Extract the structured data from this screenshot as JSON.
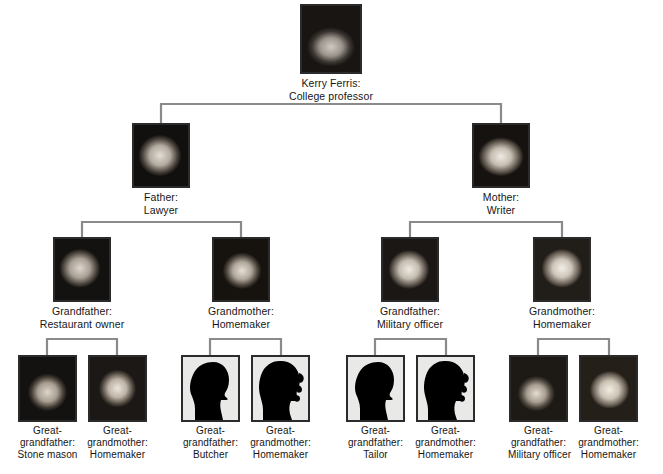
{
  "diagram": {
    "type": "family-tree",
    "generations": 4,
    "line_color": "#808080",
    "frame_color": "#2b2b2b",
    "background": "#ffffff",
    "text_color": "#161616"
  },
  "generation1": {
    "label": "Self",
    "people": [
      {
        "id": "kerry",
        "name_line": "Kerry Ferris:",
        "role_line": "College professor",
        "photo": "photo-kerry-ferris",
        "photo_type": "photograph"
      }
    ]
  },
  "generation2": {
    "label": "Parents",
    "people": [
      {
        "id": "father",
        "name_line": "Father:",
        "role_line": "Lawyer",
        "photo": "photo-father",
        "photo_type": "photograph"
      },
      {
        "id": "mother",
        "name_line": "Mother:",
        "role_line": "Writer",
        "photo": "photo-mother",
        "photo_type": "photograph"
      }
    ]
  },
  "generation3": {
    "label": "Grandparents",
    "people": [
      {
        "id": "grandfather-paternal",
        "name_line": "Grandfather:",
        "role_line": "Restaurant owner",
        "photo": "photo-grandfather-paternal",
        "photo_type": "photograph"
      },
      {
        "id": "grandmother-paternal",
        "name_line": "Grandmother:",
        "role_line": "Homemaker",
        "photo": "photo-grandmother-paternal",
        "photo_type": "photograph"
      },
      {
        "id": "grandfather-maternal",
        "name_line": "Grandfather:",
        "role_line": "Military officer",
        "photo": "photo-grandfather-maternal",
        "photo_type": "photograph"
      },
      {
        "id": "grandmother-maternal",
        "name_line": "Grandmother:",
        "role_line": "Homemaker",
        "photo": "photo-grandmother-maternal",
        "photo_type": "photograph"
      }
    ]
  },
  "generation4": {
    "label": "Great-grandparents",
    "people": [
      {
        "id": "great-grandfather-1",
        "name_line1": "Great-",
        "name_line2": "grandfather:",
        "role_line": "Stone mason",
        "photo": "photo-great-grandfather-stone-mason",
        "photo_type": "photograph"
      },
      {
        "id": "great-grandmother-1",
        "name_line1": "Great-",
        "name_line2": "grandmother:",
        "role_line": "Homemaker",
        "photo": "photo-great-grandmother-homemaker-1",
        "photo_type": "photograph"
      },
      {
        "id": "great-grandfather-2",
        "name_line1": "Great-",
        "name_line2": "grandfather:",
        "role_line": "Butcher",
        "photo": "silhouette-male",
        "photo_type": "silhouette"
      },
      {
        "id": "great-grandmother-2",
        "name_line1": "Great-",
        "name_line2": "grandmother:",
        "role_line": "Homemaker",
        "photo": "silhouette-female",
        "photo_type": "silhouette"
      },
      {
        "id": "great-grandfather-3",
        "name_line1": "Great-",
        "name_line2": "grandfather:",
        "role_line": "Tailor",
        "photo": "silhouette-male",
        "photo_type": "silhouette"
      },
      {
        "id": "great-grandmother-3",
        "name_line1": "Great-",
        "name_line2": "grandmother:",
        "role_line": "Homemaker",
        "photo": "silhouette-female",
        "photo_type": "silhouette"
      },
      {
        "id": "great-grandfather-4",
        "name_line1": "Great-",
        "name_line2": "grandfather:",
        "role_line": "Military officer",
        "photo": "photo-great-grandfather-military-officer",
        "photo_type": "photograph"
      },
      {
        "id": "great-grandmother-4",
        "name_line1": "Great-",
        "name_line2": "grandmother:",
        "role_line": "Homemaker",
        "photo": "photo-great-grandmother-homemaker-4",
        "photo_type": "photograph"
      }
    ]
  }
}
